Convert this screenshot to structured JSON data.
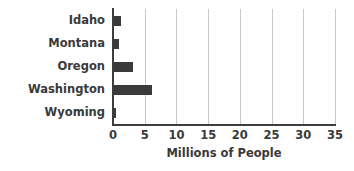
{
  "chart_data": {
    "type": "bar",
    "orientation": "horizontal",
    "title": "",
    "xlabel": "Millions of People",
    "ylabel": "",
    "categories": [
      "Idaho",
      "Montana",
      "Oregon",
      "Washington",
      "Wyoming"
    ],
    "values": [
      1.3,
      0.9,
      3.2,
      6.2,
      0.5
    ],
    "xlim": [
      0,
      35
    ],
    "xticks": [
      0,
      5,
      10,
      15,
      20,
      25,
      30,
      35
    ],
    "xtick_labels": [
      "0",
      "5",
      "10",
      "15",
      "20",
      "25",
      "30",
      "35"
    ],
    "grid": "vertical",
    "legend": "none",
    "bar_color": "#3a3a3a",
    "gridline_color": "#c8c8c8",
    "axis_color": "#3d3d3d",
    "background_color": "#ffffff"
  }
}
